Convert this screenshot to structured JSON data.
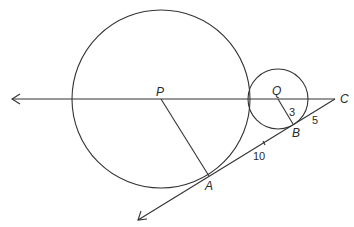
{
  "diagram": {
    "type": "geometry",
    "colors": {
      "stroke": "#333333",
      "text": "#2a2a2a",
      "background": "#ffffff"
    },
    "points": {
      "P": {
        "label": "P",
        "x": 161,
        "y": 99
      },
      "Q": {
        "label": "Q",
        "x": 278,
        "y": 99
      },
      "C": {
        "label": "C",
        "x": 335,
        "y": 99
      },
      "B": {
        "label": "B",
        "x": 293,
        "y": 124
      },
      "A": {
        "label": "A",
        "x": 209,
        "y": 176
      }
    },
    "circles": [
      {
        "name": "circle-P",
        "center": "P",
        "r": 89
      },
      {
        "name": "circle-Q",
        "center": "Q",
        "r": 30
      }
    ],
    "segment_labels": {
      "QB": "3",
      "BC": "5",
      "AB": "10"
    }
  }
}
